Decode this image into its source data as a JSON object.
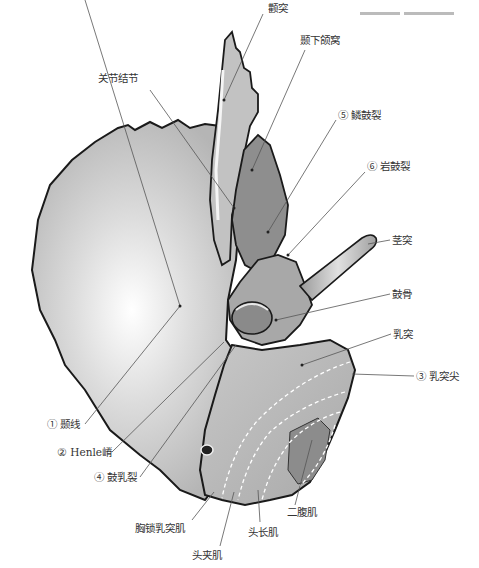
{
  "figure": {
    "labels": [
      {
        "id": "zygomatic-process",
        "text": "颧突",
        "x": 268,
        "y": 8
      },
      {
        "id": "mandibular-fossa",
        "text": "颞下颌窝",
        "x": 300,
        "y": 40
      },
      {
        "id": "articular-tubercle",
        "text": "关节结节",
        "x": 98,
        "y": 78
      },
      {
        "id": "squamotympanic-fissure",
        "text": "⑤ 鳞鼓裂",
        "x": 338,
        "y": 115
      },
      {
        "id": "petrotympanic-fissure",
        "text": "⑥ 岩鼓裂",
        "x": 367,
        "y": 166
      },
      {
        "id": "styloid-process",
        "text": "茎突",
        "x": 392,
        "y": 234
      },
      {
        "id": "tympanic-bone",
        "text": "鼓骨",
        "x": 392,
        "y": 288
      },
      {
        "id": "mastoid-process",
        "text": "乳突",
        "x": 393,
        "y": 328
      },
      {
        "id": "mastoid-tip",
        "text": "③ 乳突尖",
        "x": 416,
        "y": 370
      },
      {
        "id": "temporal-line",
        "text": "① 颞线",
        "x": 47,
        "y": 418
      },
      {
        "id": "henle-spine",
        "text": "② Henle嵴",
        "x": 57,
        "y": 448
      },
      {
        "id": "tympanomastoid-fissure",
        "text": "④ 鼓乳裂",
        "x": 94,
        "y": 473
      },
      {
        "id": "digastric-muscle",
        "text": "二腹肌",
        "x": 287,
        "y": 506
      },
      {
        "id": "sternocleidomastoid",
        "text": "胸锁乳突肌",
        "x": 135,
        "y": 523
      },
      {
        "id": "longissimus-capitis",
        "text": "头长肌",
        "x": 248,
        "y": 526
      },
      {
        "id": "splenius-capitis",
        "text": "头夹肌",
        "x": 192,
        "y": 550
      }
    ]
  },
  "colors": {
    "bone_fill": "#b9b9b9",
    "bone_light": "#f4f4f4",
    "outline": "#1a1a1a",
    "leader": "#555555",
    "text": "#333333"
  }
}
